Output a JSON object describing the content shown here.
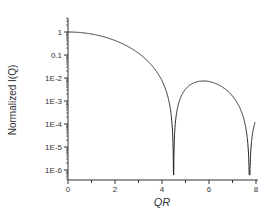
{
  "chart_data": {
    "type": "line",
    "title": "",
    "xlabel": "QR",
    "ylabel": "Normalized I(Q)",
    "xlim": [
      0,
      8
    ],
    "ylim": [
      3e-07,
      10
    ],
    "yscale": "log",
    "grid": false,
    "legend": null,
    "x_ticks": [
      "0",
      "2",
      "4",
      "6",
      "8"
    ],
    "y_ticks": [
      "1",
      "0.1",
      "1E-2",
      "1E-3",
      "1E-4",
      "1E-5",
      "1E-6"
    ],
    "series": [
      {
        "name": "sphere form factor",
        "function": "[3(sin x - x cos x)/x^3]^2",
        "x": [
          0,
          1,
          2,
          3,
          4,
          4.49,
          5,
          5.76,
          6.5,
          7,
          7.73,
          8
        ],
        "y": [
          1,
          0.81,
          0.42,
          0.11,
          0.006,
          1e-07,
          0.0028,
          0.0075,
          0.0038,
          0.0011,
          1e-07,
          0.00014
        ]
      }
    ],
    "annotations": []
  },
  "axes": {
    "x_label": "QR",
    "y_label": "Normalized I(Q)"
  }
}
